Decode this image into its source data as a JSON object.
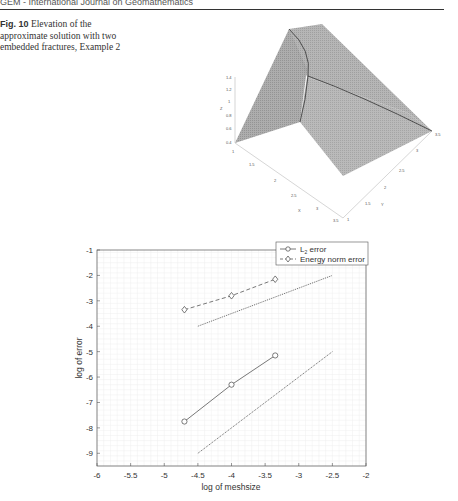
{
  "header": {
    "running_title": "GEM - International Journal on Geomathematics"
  },
  "caption": {
    "label": "Fig. 10",
    "text": "Elevation of the approximate solution with two embedded fractures, Example 2"
  },
  "surface_plot": {
    "z_ticks": [
      "1.4",
      "1.2",
      "1",
      "0.8",
      "0.6",
      "0.4"
    ],
    "x_ticks": [
      "1",
      "1.5",
      "2",
      "2.5",
      "3",
      "3.5"
    ],
    "y_ticks": [
      "1",
      "1.5",
      "2",
      "2.5",
      "3",
      "3.5"
    ],
    "xlabel": "X",
    "ylabel": "Y",
    "zlabel": "Z"
  },
  "chart_data": {
    "type": "line",
    "title": "",
    "xlabel": "log of meshsize",
    "ylabel": "log of error",
    "xlim": [
      -6,
      -2
    ],
    "ylim": [
      -9.5,
      -1
    ],
    "x_ticks": [
      "-6",
      "-5.5",
      "-5",
      "-4.5",
      "-4",
      "-3.5",
      "-3",
      "-2.5",
      "-2"
    ],
    "y_ticks": [
      "-1",
      "-2",
      "-3",
      "-4",
      "-5",
      "-6",
      "-7",
      "-8",
      "-9"
    ],
    "grid": true,
    "legend_position": "top-right",
    "series": [
      {
        "name": "L2 error",
        "legend_main": "L",
        "legend_sub": "2",
        "legend_rest": " error",
        "style": "solid",
        "marker": "circle",
        "x": [
          -4.7,
          -4.0,
          -3.35
        ],
        "y": [
          -7.75,
          -6.3,
          -5.15
        ]
      },
      {
        "name": "Energy norm error",
        "style": "dashed",
        "marker": "diamond",
        "x": [
          -4.7,
          -4.0,
          -3.35
        ],
        "y": [
          -3.35,
          -2.8,
          -2.15
        ]
      },
      {
        "name": "reference slope (L2)",
        "style": "dotted",
        "marker": "none",
        "in_legend": false,
        "x": [
          -4.5,
          -2.5
        ],
        "y": [
          -9,
          -5
        ]
      },
      {
        "name": "reference slope (energy)",
        "style": "dotted",
        "marker": "none",
        "in_legend": false,
        "x": [
          -4.5,
          -2.5
        ],
        "y": [
          -4,
          -2
        ]
      }
    ]
  }
}
